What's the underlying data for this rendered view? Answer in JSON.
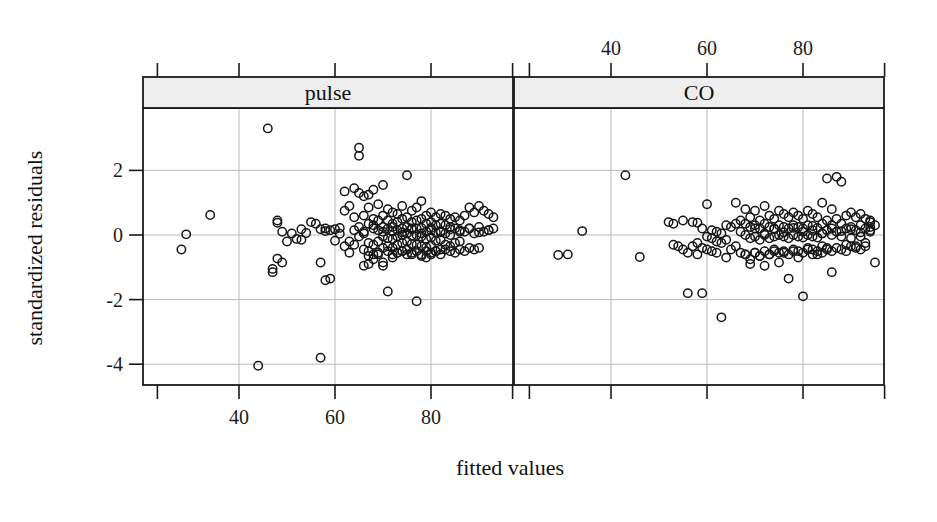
{
  "figure": {
    "x_axis_title": "fitted values",
    "y_axis_title": "standardized residuals",
    "strip_labels": [
      "pulse",
      "CO"
    ],
    "strip_fill": "#eeeeee",
    "point_color": "#161616",
    "grid_color": "#b9b9b9",
    "frame_color": "#1a1a1a"
  },
  "chart_data": {
    "type": "scatter",
    "title": "",
    "subtitle": "",
    "xlabel": "fitted values",
    "ylabel": "standardized residuals",
    "layout": "two panels side by side (lattice/trellis conditioning strips)",
    "grid": true,
    "legend": null,
    "marker": "open circle",
    "xlim": [
      23,
      97
    ],
    "ylim": [
      -4.6,
      3.6
    ],
    "x_ticks_bottom": [
      40,
      60,
      80
    ],
    "x_ticks_top": [
      40,
      60,
      80
    ],
    "y_ticks": [
      2,
      0,
      -2,
      -4
    ],
    "panels": [
      {
        "name": "pulse",
        "strip_position": "left",
        "x": [
          28,
          29,
          34,
          44,
          46,
          47,
          47,
          48,
          48,
          48,
          49,
          49,
          50,
          51,
          52,
          53,
          53,
          54,
          55,
          56,
          57,
          57,
          57,
          58,
          58,
          58,
          59,
          59,
          60,
          60,
          61,
          61,
          62,
          62,
          62,
          63,
          63,
          63,
          64,
          64,
          64,
          65,
          65,
          65,
          65,
          66,
          66,
          66,
          66,
          67,
          67,
          67,
          67,
          67,
          68,
          68,
          68,
          68,
          68,
          69,
          69,
          69,
          69,
          69,
          70,
          70,
          70,
          70,
          70,
          70,
          71,
          71,
          71,
          71,
          71,
          71,
          72,
          72,
          72,
          72,
          72,
          72,
          73,
          73,
          73,
          73,
          73,
          73,
          74,
          74,
          74,
          74,
          74,
          74,
          75,
          75,
          75,
          75,
          75,
          75,
          76,
          76,
          76,
          76,
          76,
          76,
          77,
          77,
          77,
          77,
          77,
          77,
          78,
          78,
          78,
          78,
          78,
          78,
          79,
          79,
          79,
          79,
          79,
          79,
          80,
          80,
          80,
          80,
          80,
          80,
          81,
          81,
          81,
          81,
          81,
          82,
          82,
          82,
          82,
          82,
          83,
          83,
          83,
          83,
          84,
          84,
          84,
          84,
          85,
          85,
          85,
          86,
          86,
          86,
          87,
          87,
          88,
          88,
          89,
          89,
          90,
          90,
          91,
          91,
          92,
          92,
          93,
          93,
          66,
          67,
          67,
          68,
          69,
          70,
          71,
          72,
          73,
          74,
          75,
          76,
          77,
          78,
          79,
          80,
          81,
          82,
          83,
          84,
          85,
          86,
          87,
          88,
          89,
          90,
          64,
          65,
          66,
          68,
          70,
          72,
          74,
          76,
          78,
          80,
          82,
          84,
          86,
          88,
          90,
          92
        ],
        "y": [
          -0.45,
          0.02,
          0.62,
          -4.05,
          3.3,
          -1.05,
          -1.15,
          0.38,
          -0.73,
          0.45,
          0.1,
          -0.85,
          -0.2,
          0.05,
          -0.12,
          0.18,
          -0.15,
          0.06,
          0.4,
          0.35,
          0.18,
          -0.85,
          -3.8,
          0.12,
          -1.4,
          0.2,
          0.15,
          -1.35,
          0.18,
          -0.18,
          0.22,
          0.04,
          1.35,
          0.75,
          -0.35,
          0.9,
          -0.2,
          -0.55,
          1.45,
          0.55,
          -0.3,
          2.7,
          2.45,
          1.3,
          -0.05,
          1.2,
          0.6,
          0.1,
          -0.45,
          1.25,
          0.85,
          0.35,
          -0.25,
          -0.65,
          1.4,
          0.5,
          0.2,
          -0.3,
          -0.75,
          0.95,
          0.45,
          0.15,
          -0.2,
          -0.6,
          1.55,
          0.6,
          0.25,
          -0.05,
          -0.4,
          -0.85,
          0.8,
          0.45,
          0.2,
          -0.1,
          -0.35,
          -1.75,
          0.7,
          0.35,
          0.12,
          -0.12,
          -0.4,
          -0.7,
          0.65,
          0.4,
          0.15,
          -0.05,
          -0.3,
          -0.55,
          0.9,
          0.5,
          0.2,
          0.0,
          -0.25,
          -0.5,
          1.85,
          0.55,
          0.25,
          0.05,
          -0.2,
          -0.45,
          0.75,
          0.4,
          0.18,
          -0.02,
          -0.28,
          -0.6,
          0.85,
          0.45,
          0.2,
          0.0,
          -0.3,
          -2.05,
          1.05,
          0.5,
          0.22,
          -0.05,
          -0.35,
          -0.65,
          0.6,
          0.35,
          0.1,
          -0.12,
          -0.38,
          -0.7,
          0.7,
          0.4,
          0.15,
          -0.08,
          -0.32,
          -0.6,
          0.55,
          0.3,
          0.08,
          -0.18,
          -0.5,
          0.65,
          0.35,
          0.12,
          -0.15,
          -0.45,
          0.6,
          0.3,
          0.05,
          -0.3,
          0.5,
          0.25,
          0.0,
          -0.35,
          0.55,
          0.2,
          -0.25,
          0.45,
          0.15,
          -0.2,
          0.6,
          0.1,
          0.85,
          0.2,
          0.7,
          0.05,
          0.9,
          0.25,
          0.75,
          0.1,
          0.65,
          0.15,
          0.55,
          0.2,
          -0.95,
          -0.5,
          -0.9,
          -0.6,
          -0.55,
          -0.95,
          -0.5,
          -0.6,
          -0.55,
          -0.5,
          -0.6,
          -0.55,
          -0.5,
          -0.6,
          -0.5,
          -0.55,
          -0.5,
          -0.6,
          -0.45,
          -0.5,
          -0.55,
          -0.45,
          -0.5,
          -0.4,
          -0.45,
          -0.4,
          0.15,
          0.25,
          0.05,
          0.3,
          0.1,
          0.25,
          0.08,
          0.2,
          0.05,
          0.22,
          0.08,
          0.18,
          0.1,
          0.2,
          0.08,
          0.15
        ]
      },
      {
        "name": "CO",
        "strip_position": "right",
        "x": [
          29,
          31,
          34,
          43,
          46,
          52,
          53,
          53,
          54,
          55,
          55,
          56,
          56,
          57,
          57,
          58,
          58,
          58,
          59,
          59,
          59,
          60,
          60,
          60,
          61,
          61,
          61,
          62,
          62,
          62,
          63,
          63,
          63,
          64,
          64,
          64,
          65,
          65,
          66,
          66,
          66,
          67,
          67,
          67,
          68,
          68,
          68,
          68,
          69,
          69,
          69,
          69,
          70,
          70,
          70,
          70,
          71,
          71,
          71,
          71,
          72,
          72,
          72,
          72,
          73,
          73,
          73,
          73,
          74,
          74,
          74,
          74,
          75,
          75,
          75,
          75,
          76,
          76,
          76,
          76,
          77,
          77,
          77,
          77,
          78,
          78,
          78,
          78,
          79,
          79,
          79,
          79,
          80,
          80,
          80,
          80,
          81,
          81,
          81,
          81,
          82,
          82,
          82,
          82,
          83,
          83,
          83,
          83,
          84,
          84,
          84,
          84,
          85,
          85,
          85,
          85,
          86,
          86,
          86,
          86,
          87,
          87,
          87,
          88,
          88,
          88,
          89,
          89,
          89,
          90,
          90,
          90,
          91,
          91,
          91,
          92,
          92,
          92,
          93,
          93,
          93,
          94,
          94,
          94,
          95,
          95,
          68,
          69,
          70,
          71,
          72,
          73,
          74,
          75,
          76,
          77,
          78,
          79,
          80,
          81,
          82,
          83,
          84,
          85,
          86,
          87,
          88,
          89,
          90,
          91,
          92,
          93,
          94,
          70,
          72,
          74,
          76,
          78,
          80,
          82,
          84,
          86,
          88,
          90,
          92,
          94
        ],
        "y": [
          -0.62,
          -0.6,
          0.12,
          1.85,
          -0.68,
          0.4,
          0.35,
          -0.3,
          -0.35,
          0.45,
          -0.45,
          -1.8,
          -0.55,
          0.4,
          -0.35,
          0.38,
          -0.25,
          -0.6,
          0.2,
          -0.4,
          -1.8,
          0.95,
          -0.05,
          -0.45,
          0.15,
          -0.1,
          -0.5,
          0.1,
          -0.2,
          -0.55,
          0.05,
          -0.25,
          -2.55,
          0.3,
          -0.15,
          -0.7,
          0.25,
          -0.45,
          1.0,
          0.35,
          -0.35,
          0.45,
          0.1,
          -0.55,
          0.8,
          0.35,
          0.0,
          -0.6,
          0.55,
          0.25,
          -0.1,
          -0.75,
          0.75,
          0.3,
          -0.05,
          -0.55,
          0.45,
          0.2,
          -0.15,
          -0.65,
          0.9,
          0.35,
          0.0,
          -0.5,
          0.6,
          0.25,
          -0.1,
          -0.6,
          0.5,
          0.2,
          -0.05,
          -0.45,
          0.75,
          0.3,
          0.0,
          -0.55,
          0.65,
          0.25,
          -0.05,
          -0.5,
          0.55,
          0.2,
          -0.1,
          -1.35,
          0.7,
          0.3,
          0.0,
          -0.45,
          0.6,
          0.25,
          -0.05,
          -0.5,
          0.5,
          0.2,
          -0.08,
          -1.9,
          0.75,
          0.3,
          0.0,
          -0.4,
          0.65,
          0.28,
          -0.05,
          -0.45,
          0.55,
          0.22,
          -0.08,
          -0.6,
          1.0,
          0.35,
          0.05,
          -0.35,
          1.75,
          0.45,
          0.15,
          -0.4,
          0.8,
          0.3,
          0.0,
          -1.15,
          1.8,
          0.5,
          0.1,
          1.65,
          0.35,
          -0.05,
          0.6,
          0.2,
          -0.3,
          0.7,
          0.25,
          -0.1,
          0.55,
          0.15,
          -0.35,
          0.65,
          0.3,
          -0.05,
          0.5,
          0.2,
          -0.25,
          0.45,
          0.25,
          0.4,
          0.3,
          -0.85,
          -0.6,
          -0.9,
          -0.55,
          -0.65,
          -0.95,
          -0.6,
          -0.5,
          -0.85,
          -0.55,
          -0.6,
          -0.5,
          -0.7,
          -0.55,
          -0.45,
          -0.6,
          -0.5,
          -0.55,
          -0.45,
          -0.5,
          -0.4,
          -0.45,
          -0.5,
          -0.35,
          -0.4,
          -0.45,
          -0.35,
          0.1,
          0.2,
          0.05,
          0.18,
          0.08,
          0.22,
          0.1,
          0.15,
          0.05,
          0.2,
          0.12,
          0.18,
          0.08,
          0.15
        ]
      }
    ]
  }
}
